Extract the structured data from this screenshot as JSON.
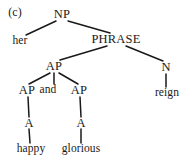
{
  "figure": {
    "label": "(c)",
    "type": "syntax-tree",
    "sentence": "her happy and glorious reign",
    "ink_color": "#191919",
    "background_color": "#ffffff"
  },
  "nodes": [
    {
      "id": "np",
      "label": "NP",
      "kind": "category",
      "x": 62,
      "y": 14
    },
    {
      "id": "her",
      "label": "her",
      "kind": "terminal",
      "x": 20,
      "y": 41
    },
    {
      "id": "phrase",
      "label": "PHRASE",
      "kind": "category",
      "x": 116,
      "y": 39
    },
    {
      "id": "ap-mid",
      "label": "AP",
      "kind": "category",
      "x": 54,
      "y": 66
    },
    {
      "id": "n",
      "label": "N",
      "kind": "category",
      "x": 166,
      "y": 67
    },
    {
      "id": "ap-left",
      "label": "AP",
      "kind": "category",
      "x": 27,
      "y": 90
    },
    {
      "id": "and",
      "label": "and",
      "kind": "terminal",
      "x": 48,
      "y": 90
    },
    {
      "id": "ap-right",
      "label": "AP",
      "kind": "category",
      "x": 79,
      "y": 90
    },
    {
      "id": "reign",
      "label": "reign",
      "kind": "terminal",
      "x": 167,
      "y": 93
    },
    {
      "id": "a-left",
      "label": "A",
      "kind": "category",
      "x": 29,
      "y": 123
    },
    {
      "id": "a-right",
      "label": "A",
      "kind": "category",
      "x": 81,
      "y": 123
    },
    {
      "id": "happy",
      "label": "happy",
      "kind": "terminal",
      "x": 31,
      "y": 149
    },
    {
      "id": "glorious",
      "label": "glorious",
      "kind": "terminal",
      "x": 81,
      "y": 149
    }
  ],
  "edges": [
    {
      "from": "np",
      "to": "her",
      "x1": 56,
      "y1": 21,
      "x2": 26,
      "y2": 35
    },
    {
      "from": "np",
      "to": "phrase",
      "x1": 68,
      "y1": 21,
      "x2": 110,
      "y2": 33
    },
    {
      "from": "phrase",
      "to": "ap-mid",
      "x1": 107,
      "y1": 46,
      "x2": 60,
      "y2": 60
    },
    {
      "from": "phrase",
      "to": "n",
      "x1": 126,
      "y1": 46,
      "x2": 163,
      "y2": 61
    },
    {
      "from": "ap-mid",
      "to": "ap-left",
      "x1": 50,
      "y1": 73,
      "x2": 29,
      "y2": 84
    },
    {
      "from": "ap-mid",
      "to": "and",
      "x1": 54,
      "y1": 73,
      "x2": 54,
      "y2": 84
    },
    {
      "from": "ap-mid",
      "to": "ap-right",
      "x1": 59,
      "y1": 73,
      "x2": 78,
      "y2": 84
    },
    {
      "from": "ap-left",
      "to": "a-left",
      "x1": 28,
      "y1": 97,
      "x2": 29,
      "y2": 117
    },
    {
      "from": "ap-right",
      "to": "a-right",
      "x1": 80,
      "y1": 97,
      "x2": 81,
      "y2": 117
    },
    {
      "from": "a-left",
      "to": "happy",
      "x1": 29,
      "y1": 129,
      "x2": 30,
      "y2": 143
    },
    {
      "from": "a-right",
      "to": "glorious",
      "x1": 81,
      "y1": 129,
      "x2": 81,
      "y2": 143
    },
    {
      "from": "n",
      "to": "reign",
      "x1": 166,
      "y1": 74,
      "x2": 166,
      "y2": 87
    }
  ]
}
